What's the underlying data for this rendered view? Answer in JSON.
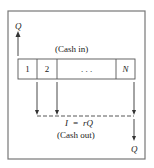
{
  "diagram": {
    "top_label": "Q",
    "cash_in_label": "(Cash in)",
    "periods": [
      "1",
      "2",
      ". . .",
      "N"
    ],
    "interest_label": "I  =  rQ",
    "cash_out_label": "(Cash out)",
    "bottom_label": "Q"
  }
}
